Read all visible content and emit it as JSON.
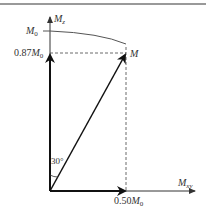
{
  "diagram": {
    "type": "vector-decomposition",
    "axes": {
      "vertical": {
        "label": "M",
        "subscript": "z"
      },
      "horizontal": {
        "label": "M",
        "subscript": "xy"
      }
    },
    "tick_labels": {
      "m0": {
        "label": "M",
        "subscript": "0"
      },
      "z_component": {
        "prefix": "0.87",
        "label": "M",
        "subscript": "0"
      },
      "xy_component": {
        "prefix": "0.50",
        "label": "M",
        "subscript": "0"
      }
    },
    "vector_label": "M",
    "angle_label": "30°",
    "colors": {
      "line": "#222222",
      "dashed": "#444444",
      "arc": "#555555",
      "top_rule": "#777777"
    }
  }
}
